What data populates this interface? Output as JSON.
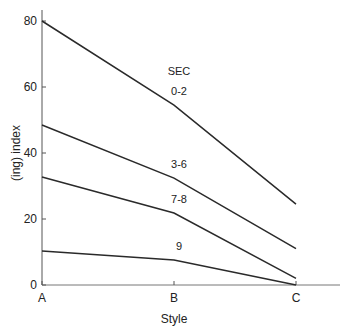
{
  "chart_data": {
    "type": "line",
    "title": "",
    "legend_title": "SEC",
    "xlabel": "Style",
    "ylabel": "(ing) index",
    "categories": [
      "A",
      "B",
      "C"
    ],
    "ylim": [
      0,
      80
    ],
    "yticks": [
      0,
      20,
      40,
      60,
      80
    ],
    "grid": false,
    "series": [
      {
        "name": "0-2",
        "values": [
          80,
          54.5,
          24.5
        ]
      },
      {
        "name": "3-6",
        "values": [
          48.5,
          32.4,
          11
        ]
      },
      {
        "name": "7-8",
        "values": [
          32.7,
          21.8,
          2
        ]
      },
      {
        "name": "9",
        "values": [
          10.3,
          7.6,
          0
        ]
      }
    ]
  }
}
